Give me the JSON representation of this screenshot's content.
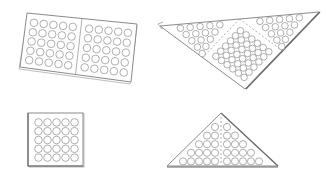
{
  "figure": {
    "colors": {
      "background": "#ffffff",
      "stroke": "#8a8a8a",
      "stroke_dark": "#6a6a6a"
    },
    "panels": [
      {
        "id": "rectangle-sheet-folded",
        "grids": [
          {
            "rows": 5,
            "cols": 5
          },
          {
            "rows": 5,
            "cols": 5
          }
        ]
      },
      {
        "id": "triangle-sheet-large",
        "sections": 3
      },
      {
        "id": "square-sheet",
        "grids": [
          {
            "rows": 5,
            "cols": 5
          }
        ]
      },
      {
        "id": "triangle-sheet-small",
        "halves": 2
      }
    ]
  }
}
